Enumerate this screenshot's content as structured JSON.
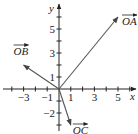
{
  "diagram": {
    "x_axis_label": "x",
    "y_axis_label": "y",
    "x_range": [
      -4,
      6
    ],
    "y_range": [
      -3,
      6
    ],
    "x_tick_labels": [
      {
        "value": -3,
        "text": "−3"
      },
      {
        "value": -1,
        "text": "−1"
      },
      {
        "value": 1,
        "text": "1"
      },
      {
        "value": 3,
        "text": "3"
      },
      {
        "value": 5,
        "text": "5"
      }
    ],
    "y_tick_labels": [
      {
        "value": 5,
        "text": "5"
      },
      {
        "value": 3,
        "text": "3"
      },
      {
        "value": 1,
        "text": "1"
      },
      {
        "value": -2,
        "text": "−2"
      }
    ],
    "vectors": [
      {
        "name": "OA",
        "label": "OA",
        "x": 5,
        "y": 6
      },
      {
        "name": "OB",
        "label": "OB",
        "x": -3,
        "y": 2
      },
      {
        "name": "OC",
        "label": "OC",
        "x": 1,
        "y": -3
      }
    ],
    "colors": {
      "axis": "#222222",
      "vector": "#555555"
    }
  }
}
